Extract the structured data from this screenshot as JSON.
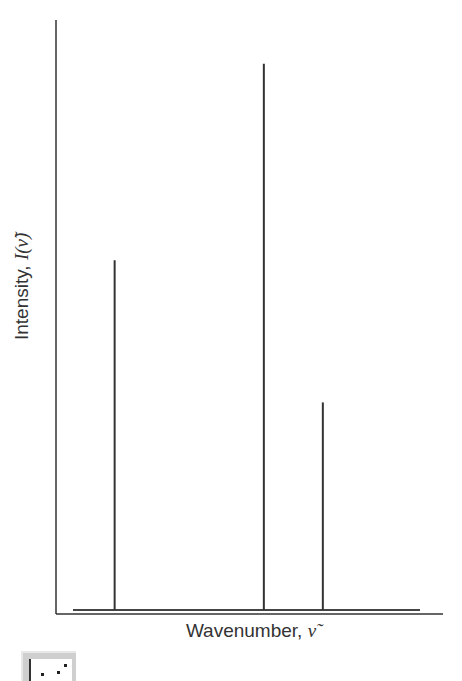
{
  "chart_data": {
    "type": "bar",
    "subtype": "stick-spectrum",
    "title": "",
    "xlabel": "Wavenumber, ν̃",
    "ylabel": "Intensity, I(ν̃)",
    "x_ticks": [],
    "y_ticks": [],
    "grid": false,
    "legend": null,
    "categories": [
      "peak 1",
      "peak 2",
      "peak 3"
    ],
    "x_relative": [
      0.12,
      0.55,
      0.72
    ],
    "values": [
      0.64,
      1.0,
      0.38
    ],
    "ylim": [
      0,
      1.08
    ],
    "note": "Relative intensities normalized to tallest peak; no numeric axis ticks shown"
  },
  "axes": {
    "xlabel_text": "Wavenumber, ",
    "xlabel_symbol": "ν̃",
    "ylabel_text": "Intensity, ",
    "ylabel_symbol": "I(ν̃)"
  },
  "colors": {
    "line": "#333333",
    "background": "#ffffff",
    "icon_bg": "#cfcfcf"
  },
  "icon": {
    "name": "chart-icon"
  }
}
